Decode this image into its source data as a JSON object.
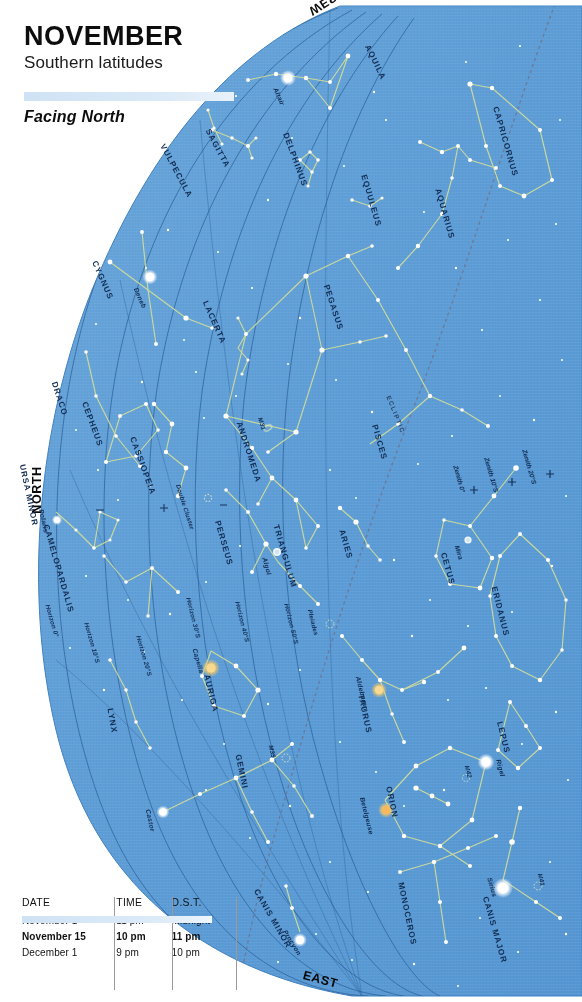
{
  "header": {
    "month": "NOVEMBER",
    "subtitle": "Southern latitudes",
    "facing": "Facing North"
  },
  "cardinals": [
    {
      "name": "north",
      "label": "NORTH"
    },
    {
      "name": "west",
      "label": "WEST"
    },
    {
      "name": "east",
      "label": "EAST"
    }
  ],
  "table": {
    "headers": [
      "DATE",
      "TIME",
      "D.S.T."
    ],
    "rows": [
      {
        "date": "November 1",
        "time": "11 pm",
        "dst": "Midnight",
        "highlight": false
      },
      {
        "date": "November 15",
        "time": "10 pm",
        "dst": "11 pm",
        "highlight": true
      },
      {
        "date": "December 1",
        "time": "9 pm",
        "dst": "10 pm",
        "highlight": false
      }
    ]
  },
  "colors": {
    "sky": "#5e9dd6",
    "sky_edge": "#4b8ecb",
    "constellation_line": "#cfdc9a",
    "grid_line": "#2d5f96",
    "ecliptic": "#6f6f86",
    "star": "#ffffff",
    "star_orange": "#f4c96a",
    "label": "#122c52",
    "band": "#cfe2f5"
  },
  "chart_data": {
    "type": "scatter",
    "projection": "horizon dome, north at left, west at top, east at bottom",
    "constellations": [
      {
        "name": "AQUILA",
        "x": 390,
        "y": 48,
        "rot": 64
      },
      {
        "name": "CAPRICORNUS",
        "x": 536,
        "y": 110,
        "rot": 74
      },
      {
        "name": "SAGITTA",
        "x": 233,
        "y": 132,
        "rot": 62
      },
      {
        "name": "VULPECULA",
        "x": 196,
        "y": 147,
        "rot": 62
      },
      {
        "name": "DELPHINUS",
        "x": 318,
        "y": 136,
        "rot": 70
      },
      {
        "name": "EQUULEUS",
        "x": 395,
        "y": 178,
        "rot": 74
      },
      {
        "name": "AQUARIUS",
        "x": 468,
        "y": 192,
        "rot": 74
      },
      {
        "name": "CYGNUS",
        "x": 119,
        "y": 264,
        "rot": 66
      },
      {
        "name": "LACERTA",
        "x": 232,
        "y": 304,
        "rot": 66
      },
      {
        "name": "PEGASUS",
        "x": 354,
        "y": 288,
        "rot": 72
      },
      {
        "name": "DRACO",
        "x": 76,
        "y": 385,
        "rot": 72
      },
      {
        "name": "CEPHEUS",
        "x": 112,
        "y": 405,
        "rot": 70
      },
      {
        "name": "CASSIOPEIA",
        "x": 167,
        "y": 440,
        "rot": 70
      },
      {
        "name": "ANDROMEDA",
        "x": 275,
        "y": 425,
        "rot": 72
      },
      {
        "name": "PISCES",
        "x": 397,
        "y": 428,
        "rot": 74
      },
      {
        "name": "URSA MINOR",
        "x": 58,
        "y": 468,
        "rot": 78
      },
      {
        "name": "PERSEUS",
        "x": 245,
        "y": 524,
        "rot": 74
      },
      {
        "name": "TRIANGULUM",
        "x": 313,
        "y": 528,
        "rot": 74
      },
      {
        "name": "ARIES",
        "x": 361,
        "y": 533,
        "rot": 74
      },
      {
        "name": "CETUS",
        "x": 464,
        "y": 556,
        "rot": 74
      },
      {
        "name": "CAMELOPARDALIS",
        "x": 96,
        "y": 528,
        "rot": 74
      },
      {
        "name": "ERIDANUS",
        "x": 524,
        "y": 590,
        "rot": 76
      },
      {
        "name": "AURIGA",
        "x": 230,
        "y": 678,
        "rot": 76
      },
      {
        "name": "TAURUS",
        "x": 385,
        "y": 698,
        "rot": 78
      },
      {
        "name": "LEPUS",
        "x": 520,
        "y": 725,
        "rot": 76
      },
      {
        "name": "GEMINI",
        "x": 260,
        "y": 758,
        "rot": 78
      },
      {
        "name": "LYNX",
        "x": 127,
        "y": 712,
        "rot": 80
      },
      {
        "name": "ORION",
        "x": 409,
        "y": 790,
        "rot": 78
      },
      {
        "name": "MONOCEROS",
        "x": 437,
        "y": 886,
        "rot": 78
      },
      {
        "name": "CANIS MINOR",
        "x": 293,
        "y": 892,
        "rot": 60
      },
      {
        "name": "CANIS MAJOR",
        "x": 524,
        "y": 900,
        "rot": 74
      }
    ],
    "named_stars": [
      {
        "name": "Altair",
        "x": 288,
        "y": 90,
        "rot": 66,
        "mag": 0.8,
        "color": "#ffffff"
      },
      {
        "name": "Deneb",
        "x": 150,
        "y": 290,
        "rot": 66,
        "mag": 1.2,
        "color": "#ffffff"
      },
      {
        "name": "Polaris",
        "x": 57,
        "y": 512,
        "rot": 78,
        "mag": 2.0,
        "color": "#ffffff"
      },
      {
        "name": "Algol",
        "x": 277,
        "y": 560,
        "rot": 74,
        "mag": 2.1,
        "color": "#ffffff"
      },
      {
        "name": "Mira",
        "x": 468,
        "y": 548,
        "rot": 74,
        "mag": 3.0,
        "color": "#ffffff"
      },
      {
        "name": "Capella",
        "x": 211,
        "y": 651,
        "rot": 74,
        "mag": 0.1,
        "color": "#f4c96a"
      },
      {
        "name": "Aldebaran",
        "x": 379,
        "y": 679,
        "rot": 76,
        "mag": 0.9,
        "color": "#f4c96a"
      },
      {
        "name": "Rigel",
        "x": 511,
        "y": 762,
        "rot": 76,
        "mag": 0.1,
        "color": "#ffffff"
      },
      {
        "name": "Betelgeuse",
        "x": 385,
        "y": 800,
        "rot": 76,
        "mag": 0.5,
        "color": "#f4c96a"
      },
      {
        "name": "Castor",
        "x": 163,
        "y": 812,
        "rot": 78,
        "mag": 1.6,
        "color": "#ffffff"
      },
      {
        "name": "Sirius",
        "x": 503,
        "y": 880,
        "rot": 74,
        "mag": -1.5,
        "color": "#ffffff"
      },
      {
        "name": "Procyon",
        "x": 302,
        "y": 932,
        "rot": 58,
        "mag": 0.4,
        "color": "#ffffff"
      }
    ],
    "deep_sky_objects": [
      {
        "name": "M31",
        "x": 270,
        "y": 420,
        "rot": 72
      },
      {
        "name": "Double Cluster",
        "x": 205,
        "y": 487,
        "rot": 72
      },
      {
        "name": "Pleiades",
        "x": 327,
        "y": 612,
        "rot": 76
      },
      {
        "name": "M35",
        "x": 281,
        "y": 748,
        "rot": 78
      },
      {
        "name": "M42",
        "x": 477,
        "y": 768,
        "rot": 76
      },
      {
        "name": "M41",
        "x": 550,
        "y": 876,
        "rot": 76
      }
    ],
    "horizon_lines": [
      {
        "label": "Horizon 0°",
        "x": 68,
        "y": 607,
        "rot": 74
      },
      {
        "label": "Horizon 10°S",
        "x": 111,
        "y": 625,
        "rot": 74
      },
      {
        "label": "Horizon 20°S",
        "x": 163,
        "y": 638,
        "rot": 74
      },
      {
        "label": "Horizon 30°S",
        "x": 213,
        "y": 600,
        "rot": 76
      },
      {
        "label": "Horizon 40°S",
        "x": 262,
        "y": 604,
        "rot": 76
      },
      {
        "label": "Horizon 50°S",
        "x": 311,
        "y": 606,
        "rot": 76
      }
    ],
    "zenith_marks": [
      {
        "label": "Zenith 0°",
        "x": 473,
        "y": 468,
        "rot": 74
      },
      {
        "label": "Zenith 10°S",
        "x": 508,
        "y": 460,
        "rot": 74
      },
      {
        "label": "Zenith 20°S",
        "x": 546,
        "y": 452,
        "rot": 74
      }
    ],
    "ecliptic": {
      "label": "ECLIPTIC",
      "x": 412,
      "y": 398,
      "rot": 68
    }
  }
}
